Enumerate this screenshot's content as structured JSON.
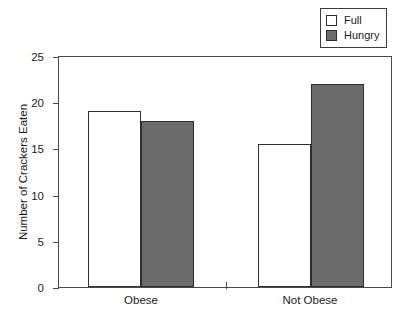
{
  "chart_data": {
    "type": "bar",
    "title": "",
    "subtitle": "",
    "xlabel": "",
    "ylabel": "Number of Crackers Eaten",
    "categories": [
      "Obese",
      "Not Obese"
    ],
    "series": [
      {
        "name": "Full",
        "values": [
          19.0,
          15.5
        ],
        "color": "#ffffff"
      },
      {
        "name": "Hungry",
        "values": [
          18.0,
          22.0
        ],
        "color": "#6b6b6b"
      }
    ],
    "ylim": [
      0,
      25
    ],
    "yticks": [
      0,
      5,
      10,
      15,
      20,
      25
    ],
    "ytick_labels": [
      "0",
      "5",
      "10",
      "15",
      "20",
      "25"
    ],
    "grid": false,
    "legend_position": "top-right",
    "legend_entries": [
      "Full",
      "Hungry"
    ]
  },
  "legend": {
    "items": [
      {
        "label": "Full",
        "swatch": "legend-swatch-full"
      },
      {
        "label": "Hungry",
        "swatch": "legend-swatch-hungry"
      }
    ]
  },
  "axes": {
    "y_title": "Number of Crackers Eaten",
    "y_ticks": [
      "25",
      "20",
      "15",
      "10",
      "5",
      "0"
    ],
    "x_labels": [
      "Obese",
      "Not Obese"
    ]
  },
  "colors": {
    "full_fill": "#ffffff",
    "hungry_fill": "#6b6b6b",
    "outline": "#2e2e2e",
    "axis": "#4a4a4a",
    "text": "#1a1a1a",
    "background": "#ffffff"
  }
}
